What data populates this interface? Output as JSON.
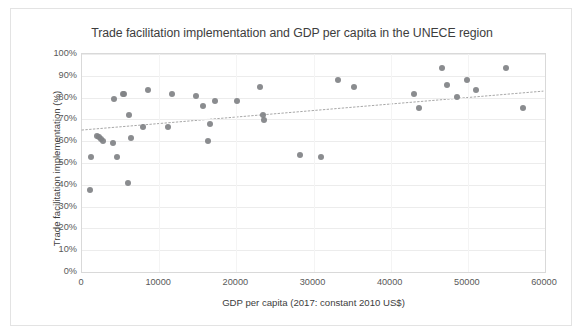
{
  "chart_data": {
    "type": "scatter",
    "title": "Trade facilitation implementation and GDP per capita in the UNECE region",
    "xlabel": "GDP per capita (2017: constant 2010 US$)",
    "ylabel": "Trade facilitation implementation (%)",
    "xlim": [
      0,
      60000
    ],
    "ylim": [
      0,
      1.0
    ],
    "grid": true,
    "legend": "none",
    "xticks": [
      "0",
      "10000",
      "20000",
      "30000",
      "40000",
      "50000",
      "60000"
    ],
    "xtick_values": [
      0,
      10000,
      20000,
      30000,
      40000,
      50000,
      60000
    ],
    "yticks": [
      "0%",
      "10%",
      "20%",
      "30%",
      "40%",
      "50%",
      "60%",
      "70%",
      "80%",
      "90%",
      "100%"
    ],
    "ytick_values": [
      0,
      10,
      20,
      30,
      40,
      50,
      60,
      70,
      80,
      90,
      100
    ],
    "marker_color": "#808285",
    "series": [
      {
        "name": "UNECE economies",
        "points": [
          [
            1100,
            37.5
          ],
          [
            1150,
            52.8
          ],
          [
            1900,
            62.5
          ],
          [
            2200,
            61.8
          ],
          [
            2500,
            60.8
          ],
          [
            2700,
            60.3
          ],
          [
            4000,
            59.3
          ],
          [
            4200,
            79.3
          ],
          [
            4500,
            52.7
          ],
          [
            5300,
            81.6
          ],
          [
            5500,
            81.6
          ],
          [
            5900,
            40.8
          ],
          [
            6100,
            72.0
          ],
          [
            6400,
            61.3
          ],
          [
            7900,
            66.5
          ],
          [
            8600,
            83.6
          ],
          [
            11200,
            66.4
          ],
          [
            11600,
            81.5
          ],
          [
            14800,
            80.7
          ],
          [
            15700,
            76.3
          ],
          [
            16300,
            60.2
          ],
          [
            16600,
            67.8
          ],
          [
            17300,
            78.6
          ],
          [
            20100,
            78.5
          ],
          [
            23100,
            84.9
          ],
          [
            23500,
            72.1
          ],
          [
            23600,
            69.6
          ],
          [
            28300,
            53.8
          ],
          [
            31000,
            52.6
          ],
          [
            33200,
            88.3
          ],
          [
            35300,
            84.9
          ],
          [
            43000,
            81.5
          ],
          [
            43700,
            75.2
          ],
          [
            46700,
            93.5
          ],
          [
            47300,
            85.9
          ],
          [
            48600,
            80.5
          ],
          [
            49900,
            88.3
          ],
          [
            51100,
            83.5
          ],
          [
            55000,
            93.4
          ],
          [
            57200,
            75.1
          ]
        ]
      }
    ],
    "trendline": {
      "style": "dotted",
      "color": "#a6a6a6",
      "x_start": 0,
      "y_start": 64.8,
      "x_end": 60000,
      "y_end": 82.8
    }
  }
}
